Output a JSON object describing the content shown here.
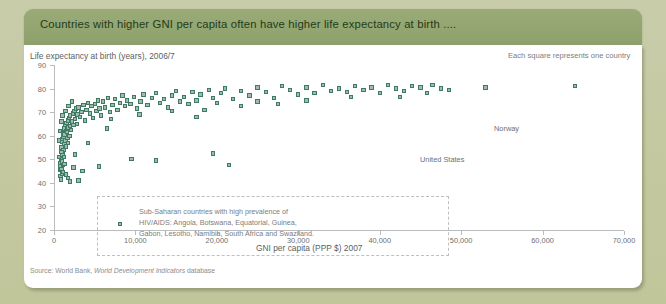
{
  "header": {
    "title": "Countries with higher GNI per capita often have higher life expectancy at birth ...."
  },
  "colors": {
    "band": "#93a571",
    "card": "#ffffff",
    "page_background": "#c5c9a4",
    "marker_fill": "#9dbcad",
    "marker_stroke": "#3f7a64",
    "axis": "#b9bbbc",
    "text": "#6d6f70"
  },
  "legend_note": "Each square represents one country",
  "source": {
    "prefix": "Source: World Bank, ",
    "italic": "World Development Indicators",
    "suffix": " database"
  },
  "annotation": {
    "line1": "Sub-Saharan countries with high prevalence of",
    "line2": "HIV/AIDS: Angola, Botswana, Equatorial, Guinea,",
    "line3": "Gabon, Lesotho, Namibia, South Africa and Swaziland."
  },
  "callouts": [
    {
      "label": "Norway",
      "x": 53000,
      "y": 80.5
    },
    {
      "label": "United States",
      "x": 45800,
      "y": 78.0
    }
  ],
  "chart_data": {
    "type": "scatter",
    "title": "Countries with higher GNI per capita often have higher life expectancy at birth ....",
    "xlabel": "GNI per capita (PPP $) 2007",
    "ylabel": "Life expectancy at birth (years), 2006/7",
    "xlim": [
      0,
      70000
    ],
    "ylim": [
      20,
      90
    ],
    "xticks": [
      0,
      10000,
      20000,
      30000,
      40000,
      50000,
      60000,
      70000
    ],
    "xtick_labels": [
      "0",
      "10,000",
      "20,000",
      "30,000",
      "40,000",
      "50,000",
      "60,000",
      "70,000"
    ],
    "yticks": [
      20,
      30,
      40,
      50,
      60,
      70,
      80,
      90
    ],
    "ytick_labels": [
      "20",
      "30",
      "40",
      "50",
      "60",
      "70",
      "80",
      "90"
    ],
    "grid": false,
    "legend_position": "top-right",
    "marker": "square",
    "series": [
      {
        "name": "Countries",
        "points": [
          [
            700,
            45.5
          ],
          [
            760,
            47.0
          ],
          [
            800,
            43.0
          ],
          [
            820,
            48.5
          ],
          [
            850,
            41.5
          ],
          [
            880,
            50.0
          ],
          [
            900,
            46.0
          ],
          [
            920,
            55.0
          ],
          [
            950,
            44.0
          ],
          [
            980,
            57.5
          ],
          [
            1000,
            49.0
          ],
          [
            1030,
            52.0
          ],
          [
            1060,
            58.5
          ],
          [
            1100,
            47.5
          ],
          [
            1120,
            61.0
          ],
          [
            1150,
            54.0
          ],
          [
            1180,
            59.5
          ],
          [
            1200,
            63.0
          ],
          [
            1240,
            51.0
          ],
          [
            1280,
            56.5
          ],
          [
            1300,
            60.5
          ],
          [
            1350,
            64.5
          ],
          [
            1400,
            58.0
          ],
          [
            1450,
            62.0
          ],
          [
            1500,
            55.5
          ],
          [
            1550,
            65.5
          ],
          [
            1600,
            61.5
          ],
          [
            1650,
            59.0
          ],
          [
            1700,
            66.5
          ],
          [
            1750,
            57.0
          ],
          [
            1800,
            63.5
          ],
          [
            1850,
            67.5
          ],
          [
            1900,
            60.0
          ],
          [
            1950,
            64.0
          ],
          [
            2000,
            68.5
          ],
          [
            2100,
            62.5
          ],
          [
            2200,
            66.0
          ],
          [
            2300,
            69.5
          ],
          [
            2400,
            64.5
          ],
          [
            2500,
            70.5
          ],
          [
            2600,
            67.0
          ],
          [
            2700,
            71.5
          ],
          [
            2800,
            65.0
          ],
          [
            2900,
            69.0
          ],
          [
            3000,
            72.0
          ],
          [
            3200,
            68.0
          ],
          [
            3400,
            70.0
          ],
          [
            3600,
            73.0
          ],
          [
            3800,
            66.5
          ],
          [
            4000,
            71.0
          ],
          [
            4200,
            74.0
          ],
          [
            4400,
            69.5
          ],
          [
            4600,
            72.5
          ],
          [
            4800,
            67.5
          ],
          [
            5000,
            73.5
          ],
          [
            5200,
            70.5
          ],
          [
            5400,
            75.0
          ],
          [
            5600,
            71.5
          ],
          [
            5800,
            68.5
          ],
          [
            6000,
            74.5
          ],
          [
            6300,
            72.0
          ],
          [
            6600,
            76.0
          ],
          [
            6900,
            70.0
          ],
          [
            7200,
            73.0
          ],
          [
            7500,
            75.5
          ],
          [
            7800,
            71.0
          ],
          [
            8100,
            74.0
          ],
          [
            8400,
            77.0
          ],
          [
            8700,
            72.5
          ],
          [
            9000,
            75.0
          ],
          [
            9400,
            73.5
          ],
          [
            9800,
            76.5
          ],
          [
            10200,
            71.5
          ],
          [
            10600,
            74.5
          ],
          [
            11000,
            77.5
          ],
          [
            11500,
            73.0
          ],
          [
            12000,
            76.0
          ],
          [
            12500,
            78.0
          ],
          [
            13000,
            74.0
          ],
          [
            13500,
            75.5
          ],
          [
            14000,
            72.0
          ],
          [
            14500,
            77.0
          ],
          [
            15000,
            79.0
          ],
          [
            15500,
            74.5
          ],
          [
            16000,
            76.5
          ],
          [
            16500,
            73.5
          ],
          [
            17000,
            78.5
          ],
          [
            17500,
            75.0
          ],
          [
            18000,
            77.5
          ],
          [
            18500,
            71.0
          ],
          [
            19000,
            79.5
          ],
          [
            19500,
            76.0
          ],
          [
            20000,
            74.0
          ],
          [
            20500,
            78.0
          ],
          [
            21000,
            80.0
          ],
          [
            22000,
            75.5
          ],
          [
            23000,
            79.0
          ],
          [
            24000,
            77.0
          ],
          [
            25000,
            80.5
          ],
          [
            26000,
            78.5
          ],
          [
            27000,
            76.0
          ],
          [
            28000,
            81.0
          ],
          [
            29000,
            79.5
          ],
          [
            30000,
            77.5
          ],
          [
            31000,
            80.5
          ],
          [
            32000,
            78.0
          ],
          [
            33000,
            81.5
          ],
          [
            34000,
            79.0
          ],
          [
            35000,
            80.0
          ],
          [
            36000,
            78.5
          ],
          [
            37000,
            81.0
          ],
          [
            38000,
            79.5
          ],
          [
            39000,
            80.5
          ],
          [
            40000,
            78.0
          ],
          [
            41000,
            81.5
          ],
          [
            42000,
            80.0
          ],
          [
            43000,
            79.0
          ],
          [
            44000,
            81.0
          ],
          [
            45000,
            80.5
          ],
          [
            45800,
            78.0
          ],
          [
            46500,
            81.5
          ],
          [
            47500,
            80.0
          ],
          [
            48500,
            79.5
          ],
          [
            53000,
            80.5
          ],
          [
            64000,
            81.0
          ],
          [
            1500,
            43.5
          ],
          [
            1700,
            42.0
          ],
          [
            2000,
            40.5
          ],
          [
            2400,
            46.5
          ],
          [
            900,
            53.0
          ],
          [
            1100,
            44.5
          ],
          [
            1300,
            48.0
          ],
          [
            600,
            51.0
          ],
          [
            650,
            58.0
          ],
          [
            700,
            62.0
          ],
          [
            5500,
            47.0
          ],
          [
            9500,
            50.0
          ],
          [
            12500,
            49.5
          ],
          [
            19500,
            52.5
          ],
          [
            21500,
            47.5
          ],
          [
            3000,
            41.0
          ],
          [
            3500,
            45.0
          ],
          [
            2600,
            52.0
          ],
          [
            4200,
            57.0
          ],
          [
            6500,
            63.0
          ],
          [
            1400,
            70.5
          ],
          [
            1800,
            72.5
          ],
          [
            2200,
            74.5
          ],
          [
            900,
            66.0
          ],
          [
            1050,
            68.5
          ],
          [
            25000,
            74.5
          ],
          [
            31000,
            75.0
          ],
          [
            36500,
            76.5
          ],
          [
            42500,
            76.5
          ],
          [
            7000,
            67.0
          ],
          [
            10500,
            69.0
          ],
          [
            14500,
            70.5
          ],
          [
            17500,
            68.0
          ],
          [
            23000,
            72.5
          ],
          [
            27500,
            73.5
          ]
        ]
      }
    ]
  }
}
